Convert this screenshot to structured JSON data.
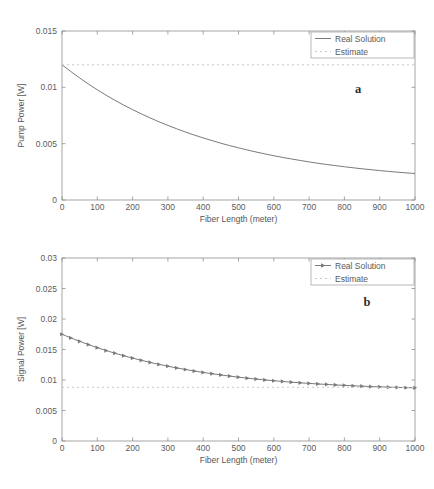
{
  "figure": {
    "panels": [
      {
        "letter": "a",
        "chart_data": {
          "type": "line",
          "title": "",
          "xlabel": "Fiber Length (meter)",
          "ylabel": "Pump Power [W]",
          "xlim": [
            0,
            1000
          ],
          "ylim": [
            0,
            0.015
          ],
          "xticks": [
            0,
            100,
            200,
            300,
            400,
            500,
            600,
            700,
            800,
            900,
            1000
          ],
          "xticklabels": [
            "0",
            "100",
            "200",
            "300",
            "400",
            "500",
            "600",
            "700",
            "800",
            "900",
            "1000"
          ],
          "yticks": [
            0,
            0.005,
            0.01,
            0.015
          ],
          "yticklabels": [
            "0",
            "0.005",
            "0.01",
            "0.015"
          ],
          "grid": false,
          "legend_position": "upper right",
          "series": [
            {
              "name": "Real Solution",
              "style": "solid",
              "color": "#6b6b6b",
              "marker": "none",
              "x": [
                0,
                25,
                50,
                75,
                100,
                125,
                150,
                175,
                200,
                225,
                250,
                275,
                300,
                325,
                350,
                375,
                400,
                425,
                450,
                475,
                500,
                525,
                550,
                575,
                600,
                625,
                650,
                675,
                700,
                725,
                750,
                775,
                800,
                825,
                850,
                875,
                900,
                925,
                950,
                975,
                1000
              ],
              "y": [
                0.012,
                0.0114,
                0.01083,
                0.01029,
                0.00978,
                0.0093,
                0.00885,
                0.00842,
                0.00802,
                0.00764,
                0.00728,
                0.00694,
                0.00662,
                0.00632,
                0.00603,
                0.00576,
                0.00551,
                0.00527,
                0.00504,
                0.00483,
                0.00463,
                0.00444,
                0.00426,
                0.00409,
                0.00393,
                0.00378,
                0.00364,
                0.00351,
                0.00338,
                0.00326,
                0.00315,
                0.00305,
                0.00295,
                0.00286,
                0.00277,
                0.00269,
                0.00261,
                0.00254,
                0.00247,
                0.00241,
                0.00235
              ]
            },
            {
              "name": "Estimate",
              "style": "dotted",
              "color": "#c9c9c9",
              "marker": "none",
              "x": [
                0,
                1000
              ],
              "y": [
                0.012,
                0.012
              ]
            }
          ]
        }
      },
      {
        "letter": "b",
        "chart_data": {
          "type": "line",
          "title": "",
          "xlabel": "Fiber Length (meter)",
          "ylabel": "Signal Power [W]",
          "xlim": [
            0,
            1000
          ],
          "ylim": [
            0,
            0.03
          ],
          "xticks": [
            0,
            100,
            200,
            300,
            400,
            500,
            600,
            700,
            800,
            900,
            1000
          ],
          "xticklabels": [
            "0",
            "100",
            "200",
            "300",
            "400",
            "500",
            "600",
            "700",
            "800",
            "900",
            "1000"
          ],
          "yticks": [
            0,
            0.005,
            0.01,
            0.015,
            0.02,
            0.025,
            0.03
          ],
          "yticklabels": [
            "0",
            "0.005",
            "0.01",
            "0.015",
            "0.02",
            "0.025",
            "0.03"
          ],
          "grid": false,
          "legend_position": "upper right",
          "series": [
            {
              "name": "Real Solution",
              "style": "solid",
              "color": "#6b6b6b",
              "marker": "triangle-right",
              "x": [
                0,
                25,
                50,
                75,
                100,
                125,
                150,
                175,
                200,
                225,
                250,
                275,
                300,
                325,
                350,
                375,
                400,
                425,
                450,
                475,
                500,
                525,
                550,
                575,
                600,
                625,
                650,
                675,
                700,
                725,
                750,
                775,
                800,
                825,
                850,
                875,
                900,
                925,
                950,
                975,
                1000
              ],
              "y": [
                0.0175,
                0.0169,
                0.01634,
                0.0158,
                0.0153,
                0.01483,
                0.01439,
                0.01398,
                0.01359,
                0.01322,
                0.01288,
                0.01256,
                0.01226,
                0.01198,
                0.01172,
                0.01147,
                0.01124,
                0.01103,
                0.01083,
                0.01064,
                0.01046,
                0.0103,
                0.01015,
                0.01001,
                0.00988,
                0.00976,
                0.00964,
                0.00954,
                0.00944,
                0.00935,
                0.00927,
                0.00919,
                0.00912,
                0.00905,
                0.00899,
                0.00893,
                0.00888,
                0.00883,
                0.00879,
                0.00875,
                0.00871
              ]
            },
            {
              "name": "Estimate",
              "style": "dotted",
              "color": "#c9c9c9",
              "marker": "none",
              "x": [
                0,
                1000
              ],
              "y": [
                0.0088,
                0.0088
              ]
            }
          ]
        }
      }
    ]
  }
}
